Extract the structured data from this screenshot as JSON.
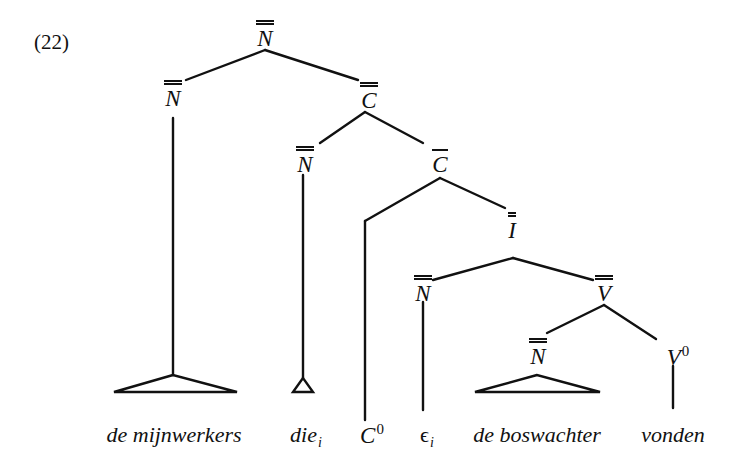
{
  "example_number": "(22)",
  "nodes": {
    "root": {
      "category": "N",
      "bars": 2
    },
    "n_left": {
      "category": "N",
      "bars": 2
    },
    "c_double": {
      "category": "C",
      "bars": 2
    },
    "n_die": {
      "category": "N",
      "bars": 2
    },
    "c_bar": {
      "category": "C",
      "bars": 1
    },
    "c_zero": {
      "category": "C",
      "superscript": "0"
    },
    "i_double": {
      "category": "I",
      "bars": 2
    },
    "n_eps": {
      "category": "N",
      "bars": 2
    },
    "v_double": {
      "category": "V",
      "bars": 2
    },
    "n_obj": {
      "category": "N",
      "bars": 2
    },
    "v_zero": {
      "category": "V",
      "superscript": "0"
    }
  },
  "leaves": {
    "mijnwerkers": "de mijnwerkers",
    "die": {
      "text": "die",
      "subscript": "i"
    },
    "eps": {
      "text": "ϵ",
      "subscript": "i"
    },
    "boswachter": "de boswachter",
    "vonden": "vonden"
  },
  "colors": {
    "ink": "#111111",
    "background": "#ffffff"
  }
}
